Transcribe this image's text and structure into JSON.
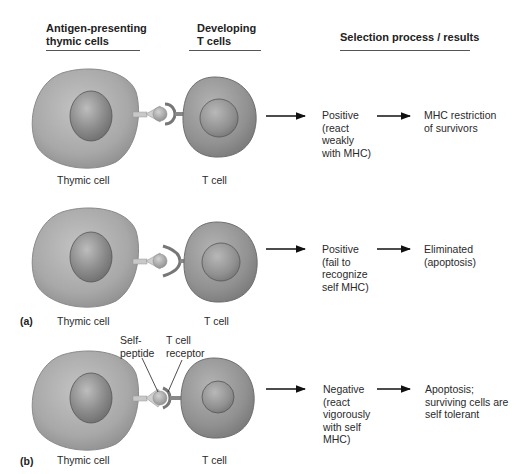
{
  "headers": {
    "antigen_presenting": "Antigen-presenting\nthymic cells",
    "antigen_line1": "Antigen-presenting",
    "antigen_line2": "thymic cells",
    "developing_line1": "Developing",
    "developing_line2": "T cells",
    "selection": "Selection process / results"
  },
  "rows": [
    {
      "thymic_label": "Thymic cell",
      "tcell_label": "T cell",
      "process": "Positive\n(react\nweakly\nwith MHC)",
      "result": "MHC restriction\nof survivors",
      "receptor_shape": "fitting-receptor"
    },
    {
      "panel": "(a)",
      "thymic_label": "Thymic cell",
      "tcell_label": "T cell",
      "process": "Positive\n(fail to\nrecognize\nself MHC)",
      "result": "Eliminated\n(apoptosis)",
      "receptor_shape": "non-fitting-receptor"
    },
    {
      "panel": "(b)",
      "thymic_label": "Thymic cell",
      "tcell_label": "T cell",
      "process": "Negative\n(react\nvigorously\nwith self\nMHC)",
      "result": "Apoptosis;\nsurviving cells are\nself tolerant",
      "callouts": {
        "self_peptide": "Self-\npeptide",
        "tcell_receptor": "T cell\nreceptor"
      },
      "receptor_shape": "tight-binding-receptor"
    }
  ],
  "colors": {
    "cell_fill": "#a9a9a9",
    "cell_edge": "#7a7a7a",
    "nucleus_fill": "#8e8e8e",
    "tcell_fill": "#9a9a9a",
    "arrow": "#111111"
  }
}
